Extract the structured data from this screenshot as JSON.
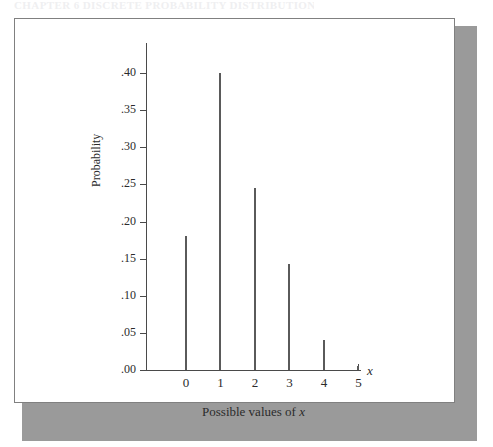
{
  "header": {
    "text": "CHAPTER 6   DISCRETE PROBABILITY DISTRIBUTIONS"
  },
  "figure": {
    "background_color": "#ffffff",
    "border_color": "#808080",
    "shadow_color": "#9a9a9a"
  },
  "axes": {
    "y_title": "Probability",
    "x_title_prefix": "Possible values of ",
    "x_title_variable": "x",
    "x_axis_end_label": "x",
    "axis_color": "#4a4a4a",
    "bar_color": "#5a5a5a"
  },
  "chart_data": {
    "type": "bar",
    "title": "",
    "subtitle": "",
    "xlabel": "Possible values of x",
    "ylabel": "Probability",
    "categories": [
      "0",
      "1",
      "2",
      "3",
      "4",
      "5"
    ],
    "values": [
      0.18,
      0.4,
      0.245,
      0.143,
      0.04,
      0.006
    ],
    "xlim": [
      -0.5,
      5.5
    ],
    "ylim": [
      0.0,
      0.44
    ],
    "ytick_values": [
      0.0,
      0.05,
      0.1,
      0.15,
      0.2,
      0.25,
      0.3,
      0.35,
      0.4
    ],
    "ytick_labels": [
      ".00",
      ".05",
      ".10",
      ".15",
      ".20",
      ".25",
      ".30",
      ".35",
      ".40"
    ],
    "xtick_labels": [
      "0",
      "1",
      "2",
      "3",
      "4",
      "5"
    ],
    "grid": false,
    "legend": false,
    "style": "spike/needle plot (thin vertical lines)"
  }
}
